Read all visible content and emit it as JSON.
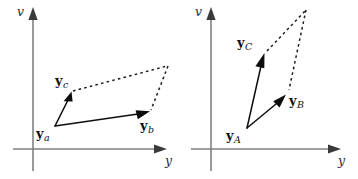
{
  "figure": {
    "type": "vector-diagram",
    "background_color": "#ffffff",
    "axis_color": "#808080",
    "vector_color": "#0d0d0d",
    "dashed_color": "#1a1a1a",
    "panels": [
      {
        "id": "left-panel",
        "axis_labels": {
          "vertical": "v",
          "horizontal": "y"
        },
        "origin": {
          "x": 33,
          "y": 149
        },
        "vector_origin": {
          "x": 55,
          "y": 126
        },
        "vectors": [
          {
            "name": "y_c",
            "label_base": "y",
            "label_sub": "c",
            "from": {
              "x": 55,
              "y": 126
            },
            "to": {
              "x": 71,
              "y": 93
            },
            "label_pos": {
              "x": 55,
              "y": 74
            }
          },
          {
            "name": "y_b",
            "label_base": "y",
            "label_sub": "b",
            "from": {
              "x": 55,
              "y": 126
            },
            "to": {
              "x": 149,
              "y": 112
            },
            "label_pos": {
              "x": 140,
              "y": 119
            }
          }
        ],
        "origin_label": {
          "name": "y_a",
          "label_base": "y",
          "label_sub": "a",
          "label_pos": {
            "x": 36,
            "y": 127
          }
        },
        "dashed_paths": [
          {
            "from": {
              "x": 71,
              "y": 93
            },
            "to": {
              "x": 168,
              "y": 66
            }
          },
          {
            "from": {
              "x": 168,
              "y": 66
            },
            "to": {
              "x": 150,
              "y": 111
            }
          }
        ]
      },
      {
        "id": "right-panel",
        "axis_labels": {
          "vertical": "v",
          "horizontal": "y"
        },
        "origin": {
          "x": 211,
          "y": 149
        },
        "vector_origin": {
          "x": 247,
          "y": 128
        },
        "vectors": [
          {
            "name": "y_C",
            "label_base": "y",
            "label_sub": "C",
            "from": {
              "x": 247,
              "y": 128
            },
            "to": {
              "x": 264,
              "y": 54
            },
            "label_pos": {
              "x": 238,
              "y": 36
            }
          },
          {
            "name": "y_B",
            "label_base": "y",
            "label_sub": "B",
            "from": {
              "x": 247,
              "y": 128
            },
            "to": {
              "x": 285,
              "y": 95
            },
            "label_pos": {
              "x": 288,
              "y": 93
            }
          }
        ],
        "origin_label": {
          "name": "y_A",
          "label_base": "y",
          "label_sub": "A",
          "label_pos": {
            "x": 226,
            "y": 129
          }
        },
        "dashed_paths": [
          {
            "from": {
              "x": 266,
              "y": 52
            },
            "to": {
              "x": 306,
              "y": 10
            }
          },
          {
            "from": {
              "x": 306,
              "y": 10
            },
            "to": {
              "x": 288,
              "y": 92
            }
          }
        ]
      }
    ]
  },
  "labels": {
    "left": {
      "v_axis": "v",
      "y_axis": "y",
      "ya_base": "y",
      "ya_sub": "a",
      "yb_base": "y",
      "yb_sub": "b",
      "yc_base": "y",
      "yc_sub": "c"
    },
    "right": {
      "v_axis": "v",
      "y_axis": "y",
      "yA_base": "y",
      "yA_sub": "A",
      "yB_base": "y",
      "yB_sub": "B",
      "yC_base": "y",
      "yC_sub": "C"
    }
  }
}
